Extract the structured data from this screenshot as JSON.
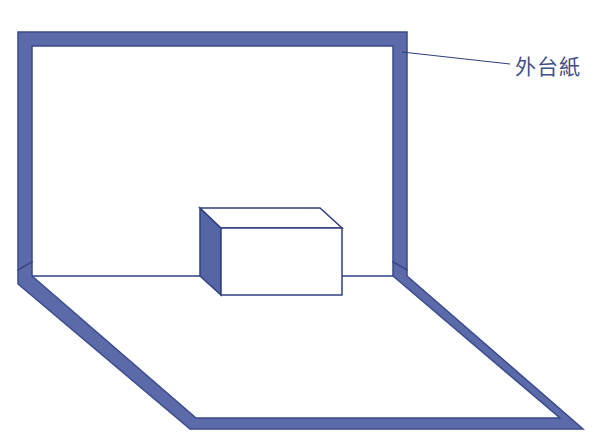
{
  "diagram": {
    "label": "外台紙",
    "colors": {
      "frame": "#5b6aa8",
      "frame_edge": "#3a4a8c",
      "line": "#2f3f80",
      "box_side": "#5566a6",
      "background": "#ffffff"
    }
  }
}
